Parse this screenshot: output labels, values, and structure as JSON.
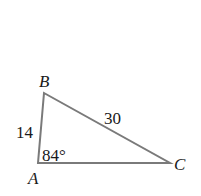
{
  "diagram": {
    "type": "triangle",
    "stroke_color": "#7a7a7a",
    "text_color": "#1a1a1a",
    "vertices": {
      "A": {
        "label": "A",
        "x": 38,
        "y": 163
      },
      "B": {
        "label": "B",
        "x": 44,
        "y": 93
      },
      "C": {
        "label": "C",
        "x": 170,
        "y": 163
      }
    },
    "sides": {
      "AB": {
        "label": "14"
      },
      "BC": {
        "label": "30"
      }
    },
    "angles": {
      "A": {
        "label": "84°"
      }
    }
  }
}
